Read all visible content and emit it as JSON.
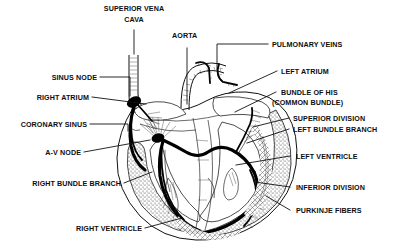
{
  "figure": {
    "background_color": "#ffffff",
    "ink_color": "#111111",
    "width": 393,
    "height": 248
  },
  "labels": {
    "superior_vena_cava_line1": "SUPERIOR VENA",
    "superior_vena_cava_line2": "CAVA",
    "aorta": "AORTA",
    "pulmonary_veins": "PULMONARY VEINS",
    "left_atrium": "LEFT ATRIUM",
    "bundle_of_his_line1": "BUNDLE OF HIS",
    "bundle_of_his_line2": "(COMMON BUNDLE)",
    "superior_division": "SUPERIOR DIVISION",
    "left_bundle_branch": "LEFT BUNDLE BRANCH",
    "left_ventricle": "LEFT VENTRICLE",
    "inferior_division": "INFERIOR DIVISION",
    "purkinje_fibers": "PURKINJE FIBERS",
    "sinus_node": "SINUS NODE",
    "right_atrium": "RIGHT ATRIUM",
    "coronary_sinus": "CORONARY SINUS",
    "av_node": "A-V NODE",
    "right_bundle_branch": "RIGHT BUNDLE BRANCH",
    "right_ventricle": "RIGHT VENTRICLE"
  }
}
